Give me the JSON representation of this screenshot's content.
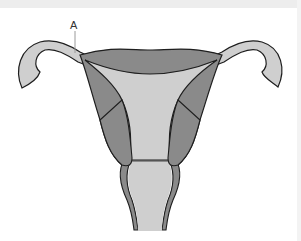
{
  "diagram": {
    "labels": [
      {
        "id": "A",
        "text": "A",
        "x": 70,
        "y": 20
      }
    ],
    "colors": {
      "background": "#ffffff",
      "top_band": "#ededed",
      "dark_tissue": "#8a8a8a",
      "light_tissue": "#cfcfcf",
      "outline": "#1e1e1e",
      "leader_line": "#9a9a9a"
    }
  }
}
